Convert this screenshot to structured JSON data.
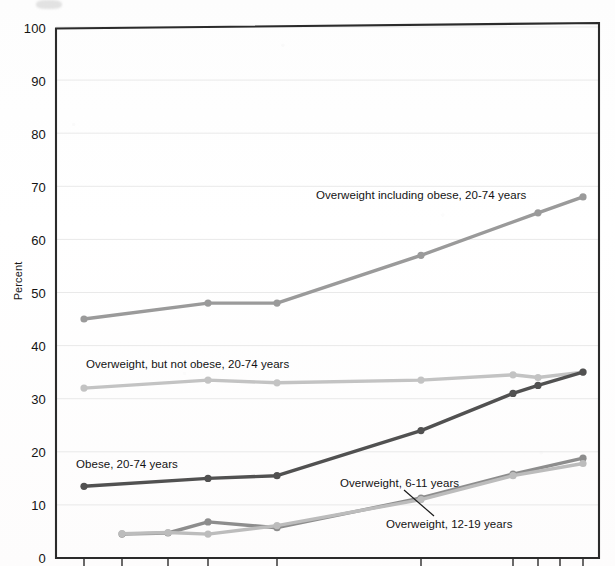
{
  "chart_data": {
    "type": "line",
    "title": "",
    "xlabel": "",
    "ylabel": "Percent",
    "ylim": [
      0,
      100
    ],
    "ytick_labels": [
      "0",
      "10",
      "20",
      "30",
      "40",
      "50",
      "60",
      "70",
      "80",
      "90",
      "100"
    ],
    "ytick_values": [
      0,
      10,
      20,
      30,
      40,
      50,
      60,
      70,
      80,
      90,
      100
    ],
    "xtick_labels": [
      "",
      "",
      "",
      "",
      "",
      "",
      "",
      "",
      "",
      ""
    ],
    "grid": true,
    "legend_position": "inline-annotations",
    "x_positions_px": [
      84,
      122,
      168,
      208,
      277,
      421,
      513,
      538,
      560,
      583
    ],
    "series": [
      {
        "name": "Overweight including obese, 20-74 years",
        "color": "#9a9a9a",
        "x_px": [
          84,
          208,
          277,
          421,
          538,
          583
        ],
        "values": [
          45,
          48,
          48,
          57,
          65,
          68
        ],
        "annotation": "Overweight including obese, 20-74 years",
        "annotation_px": {
          "x": 316,
          "y": 189
        }
      },
      {
        "name": "Overweight, but not obese, 20-74 years",
        "color": "#c3c3c3",
        "x_px": [
          84,
          208,
          277,
          421,
          513,
          538,
          583
        ],
        "values": [
          32,
          33.5,
          33,
          33.5,
          34.5,
          34,
          35
        ],
        "annotation": "Overweight, but not obese, 20-74 years",
        "annotation_px": {
          "x": 86,
          "y": 358
        }
      },
      {
        "name": "Obese, 20-74 years",
        "color": "#515151",
        "x_px": [
          84,
          208,
          277,
          421,
          513,
          538,
          583
        ],
        "values": [
          13.5,
          15,
          15.5,
          24,
          31,
          32.5,
          35
        ],
        "annotation": "Obese, 20-74 years",
        "annotation_px": {
          "x": 76,
          "y": 458
        }
      },
      {
        "name": "Overweight, 6-11 years",
        "color": "#8d8d8d",
        "x_px": [
          122,
          168,
          208,
          277,
          421,
          513,
          583
        ],
        "values": [
          4.5,
          4.7,
          6.8,
          5.7,
          11.3,
          15.8,
          18.8
        ],
        "annotation": "Overweight, 6-11 years",
        "annotation_px": {
          "x": 340,
          "y": 477
        }
      },
      {
        "name": "Overweight, 12-19 years",
        "color": "#bcbcbc",
        "x_px": [
          122,
          168,
          208,
          277,
          421,
          513,
          583
        ],
        "values": [
          4.6,
          4.8,
          4.5,
          6.1,
          11.0,
          15.5,
          17.8
        ],
        "annotation": "Overweight, 12-19 years",
        "annotation_px": {
          "x": 386,
          "y": 518
        }
      }
    ]
  },
  "axis": {
    "y_title": "Percent",
    "tick_labels": [
      "100",
      "90",
      "80",
      "70",
      "60",
      "50",
      "40",
      "30",
      "20",
      "10",
      "0"
    ]
  },
  "colors": {
    "plot_border": "#2b2b2b",
    "gridline": "#e9e9e9",
    "background": "#ffffff"
  }
}
